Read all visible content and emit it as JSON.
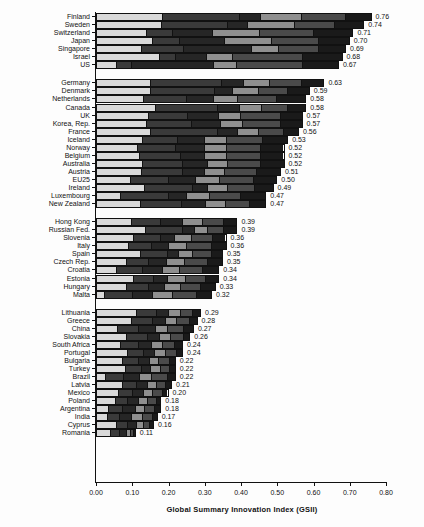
{
  "chart_data": {
    "type": "bar",
    "orientation": "horizontal",
    "stacked": true,
    "title": "",
    "xlabel": "Global Summary Innovation Index (GSII)",
    "ylabel": "",
    "xlim": [
      0.0,
      0.8
    ],
    "xticks": [
      "0.00",
      "0.10",
      "0.20",
      "0.30",
      "0.40",
      "0.50",
      "0.60",
      "0.70",
      "0.80"
    ],
    "xtick_values": [
      0.0,
      0.1,
      0.2,
      0.3,
      0.4,
      0.5,
      0.6,
      0.7,
      0.8
    ],
    "grid": false,
    "legend": "none",
    "segment_colors": [
      "#d9d9d9",
      "#3a3a3a",
      "#262626",
      "#8f8f8f",
      "#4a4a4a",
      "#1a1a1a"
    ],
    "groups": [
      {
        "name": "group-1",
        "categories": [
          "Finland",
          "Sweden",
          "Switzerland",
          "Japan",
          "Singapore",
          "Israel",
          "US"
        ],
        "values": [
          0.76,
          0.74,
          0.71,
          0.7,
          0.69,
          0.68,
          0.67
        ],
        "labels": [
          "0.76",
          "0.74",
          "0.71",
          "0.70",
          "0.69",
          "0.68",
          "0.67"
        ],
        "segments": [
          [
            0.185,
            0.215,
            0.055,
            0.115,
            0.12,
            0.07
          ],
          [
            0.18,
            0.185,
            0.055,
            0.13,
            0.11,
            0.08
          ],
          [
            0.14,
            0.07,
            0.11,
            0.13,
            0.15,
            0.11
          ],
          [
            0.155,
            0.075,
            0.125,
            0.13,
            0.13,
            0.085
          ],
          [
            0.125,
            0.115,
            0.19,
            0.075,
            0.11,
            0.075
          ],
          [
            0.175,
            0.045,
            0.085,
            0.07,
            0.195,
            0.11
          ],
          [
            0.055,
            0.04,
            0.23,
            0.06,
            0.185,
            0.1
          ]
        ]
      },
      {
        "name": "group-2",
        "categories": [
          "Germany",
          "Denmark",
          "Netherlands",
          "Canada",
          "UK",
          "Korea, Rep.",
          "France",
          "Iceland",
          "Norway",
          "Belgium",
          "Australia",
          "Austria",
          "EU25",
          "Ireland",
          "Luxembourg",
          "New Zealand"
        ],
        "values": [
          0.63,
          0.59,
          0.58,
          0.58,
          0.57,
          0.57,
          0.56,
          0.53,
          0.52,
          0.52,
          0.52,
          0.51,
          0.5,
          0.49,
          0.47,
          0.47
        ],
        "labels": [
          "0.63",
          "0.59",
          "0.58",
          "0.58",
          "0.57",
          "0.57",
          "0.56",
          "0.53",
          "0.52",
          "0.52",
          "0.52",
          "0.51",
          "0.50",
          "0.49",
          "0.47",
          "0.47"
        ],
        "segments": [
          [
            0.15,
            0.2,
            0.06,
            0.07,
            0.09,
            0.06
          ],
          [
            0.15,
            0.18,
            0.05,
            0.07,
            0.08,
            0.06
          ],
          [
            0.13,
            0.12,
            0.075,
            0.065,
            0.11,
            0.08
          ],
          [
            0.165,
            0.175,
            0.06,
            0.06,
            0.07,
            0.05
          ],
          [
            0.145,
            0.11,
            0.085,
            0.06,
            0.11,
            0.06
          ],
          [
            0.14,
            0.125,
            0.08,
            0.06,
            0.105,
            0.06
          ],
          [
            0.15,
            0.19,
            0.055,
            0.055,
            0.07,
            0.04
          ],
          [
            0.13,
            0.095,
            0.075,
            0.06,
            0.1,
            0.07
          ],
          [
            0.115,
            0.105,
            0.08,
            0.06,
            0.095,
            0.065
          ],
          [
            0.12,
            0.115,
            0.065,
            0.06,
            0.095,
            0.065
          ],
          [
            0.13,
            0.11,
            0.07,
            0.055,
            0.09,
            0.065
          ],
          [
            0.125,
            0.115,
            0.06,
            0.055,
            0.09,
            0.065
          ],
          [
            0.095,
            0.105,
            0.075,
            0.065,
            0.095,
            0.065
          ],
          [
            0.135,
            0.135,
            0.04,
            0.055,
            0.075,
            0.05
          ],
          [
            0.065,
            0.135,
            0.05,
            0.065,
            0.085,
            0.07
          ],
          [
            0.125,
            0.115,
            0.065,
            0.055,
            0.065,
            0.045
          ]
        ]
      },
      {
        "name": "group-3",
        "categories": [
          "Hong Kong",
          "Russian Fed.",
          "Slovenia",
          "Italy",
          "Spain",
          "Czech Rep.",
          "Croatia",
          "Estonia",
          "Hungary",
          "Malta"
        ],
        "values": [
          0.39,
          0.39,
          0.36,
          0.36,
          0.35,
          0.35,
          0.34,
          0.34,
          0.33,
          0.32
        ],
        "labels": [
          "0.39",
          "0.39",
          "0.36",
          "0.36",
          "0.35",
          "0.35",
          "0.34",
          "0.34",
          "0.33",
          "0.32"
        ],
        "segments": [
          [
            0.1,
            0.08,
            0.06,
            0.055,
            0.06,
            0.035
          ],
          [
            0.14,
            0.105,
            0.03,
            0.035,
            0.045,
            0.035
          ],
          [
            0.105,
            0.075,
            0.04,
            0.045,
            0.06,
            0.035
          ],
          [
            0.09,
            0.065,
            0.045,
            0.05,
            0.07,
            0.04
          ],
          [
            0.125,
            0.075,
            0.03,
            0.04,
            0.05,
            0.03
          ],
          [
            0.085,
            0.06,
            0.05,
            0.05,
            0.065,
            0.04
          ],
          [
            0.055,
            0.075,
            0.055,
            0.045,
            0.065,
            0.045
          ],
          [
            0.105,
            0.055,
            0.04,
            0.05,
            0.055,
            0.035
          ],
          [
            0.085,
            0.06,
            0.045,
            0.045,
            0.055,
            0.04
          ],
          [
            0.02,
            0.08,
            0.055,
            0.055,
            0.07,
            0.04
          ]
        ]
      },
      {
        "name": "group-4",
        "categories": [
          "Lithuania",
          "Greece",
          "China",
          "Slovakia",
          "South Africa",
          "Portugal",
          "Bulgaria",
          "Turkey",
          "Brazil",
          "Latvia",
          "Mexico",
          "Poland",
          "Argentina",
          "India",
          "Cyprus",
          "Romania"
        ],
        "values": [
          0.29,
          0.28,
          0.27,
          0.26,
          0.24,
          0.24,
          0.22,
          0.22,
          0.22,
          0.21,
          0.2,
          0.18,
          0.18,
          0.17,
          0.16,
          0.11
        ],
        "labels": [
          "0.29",
          "0.28",
          "0.27",
          "0.26",
          "0.24",
          "0.24",
          "0.22",
          "0.22",
          "0.22",
          "0.21",
          "0.20",
          "0.18",
          "0.18",
          "0.17",
          "0.16",
          "0.11"
        ],
        "segments": [
          [
            0.115,
            0.055,
            0.035,
            0.03,
            0.035,
            0.02
          ],
          [
            0.1,
            0.06,
            0.035,
            0.03,
            0.035,
            0.02
          ],
          [
            0.06,
            0.06,
            0.045,
            0.035,
            0.045,
            0.025
          ],
          [
            0.085,
            0.06,
            0.035,
            0.03,
            0.035,
            0.015
          ],
          [
            0.07,
            0.05,
            0.035,
            0.03,
            0.035,
            0.02
          ],
          [
            0.09,
            0.045,
            0.03,
            0.03,
            0.03,
            0.015
          ],
          [
            0.075,
            0.045,
            0.03,
            0.025,
            0.03,
            0.015
          ],
          [
            0.085,
            0.045,
            0.025,
            0.025,
            0.025,
            0.015
          ],
          [
            0.025,
            0.05,
            0.045,
            0.035,
            0.045,
            0.02
          ],
          [
            0.075,
            0.04,
            0.03,
            0.025,
            0.025,
            0.015
          ],
          [
            0.065,
            0.04,
            0.03,
            0.025,
            0.025,
            0.015
          ],
          [
            0.055,
            0.035,
            0.03,
            0.025,
            0.025,
            0.01
          ],
          [
            0.035,
            0.04,
            0.035,
            0.025,
            0.03,
            0.015
          ],
          [
            0.03,
            0.035,
            0.035,
            0.03,
            0.03,
            0.01
          ],
          [
            0.06,
            0.03,
            0.025,
            0.02,
            0.015,
            0.01
          ],
          [
            0.045,
            0.025,
            0.02,
            0.01,
            0.007,
            0.003
          ]
        ]
      }
    ]
  }
}
